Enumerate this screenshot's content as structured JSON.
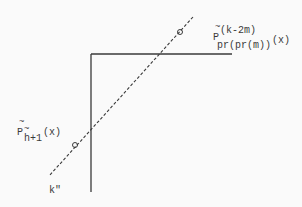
{
  "diagram": {
    "colors": {
      "line": "#3a3a3a",
      "background": "#fafafa"
    },
    "upper_label": {
      "tilde": "~",
      "base": "P",
      "superscript": "(k-2m)",
      "subscript": "pr(pr(m))",
      "argument": "(x)"
    },
    "lower_label": {
      "tilde": "~",
      "base": "P",
      "subscript_tilde": "~",
      "subscript": "h+1",
      "argument": "(x)"
    },
    "axis_label": "k\"",
    "shapes": {
      "horizontal_line": {
        "x1": 91,
        "y1": 54,
        "x2": 232,
        "y2": 54
      },
      "vertical_line": {
        "x1": 91,
        "y1": 54,
        "x2": 91,
        "y2": 192
      },
      "dashed_line": {
        "x1": 193,
        "y1": 17,
        "x2": 49,
        "y2": 176
      },
      "circles": [
        {
          "cx": 180,
          "cy": 32,
          "r": 2.5
        },
        {
          "cx": 75,
          "cy": 145,
          "r": 2.5
        }
      ]
    }
  }
}
